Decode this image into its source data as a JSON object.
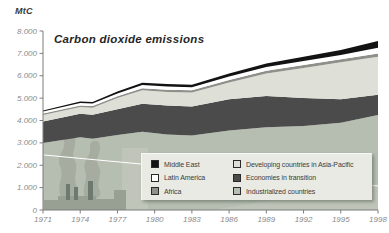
{
  "page": {
    "background": "#ffffff"
  },
  "chart_data": {
    "type": "area",
    "stacked": true,
    "title": "Carbon dioxide emissions",
    "unit_label": "MtC",
    "grid": false,
    "x": [
      1971,
      1974,
      1975,
      1977,
      1979,
      1981,
      1983,
      1986,
      1989,
      1992,
      1995,
      1998
    ],
    "x_axis": {
      "range": [
        1971,
        1998
      ],
      "tick_years": [
        1971,
        1974,
        1977,
        1980,
        1983,
        1986,
        1989,
        1992,
        1995,
        1998
      ],
      "tick_labels": [
        "1971",
        "1974",
        "1977",
        "1980",
        "1983",
        "1986",
        "1989",
        "1992",
        "1995",
        "1998"
      ]
    },
    "y_axis": {
      "range": [
        0,
        8000
      ],
      "ticks": [
        {
          "value": 8000,
          "label": "8.000"
        },
        {
          "value": 7000,
          "label": "7.000"
        },
        {
          "value": 6000,
          "label": "6.000"
        },
        {
          "value": 5000,
          "label": "5.000"
        },
        {
          "value": 4000,
          "label": "4.000"
        },
        {
          "value": 3000,
          "label": "3.000"
        },
        {
          "value": 2000,
          "label": "2.000"
        },
        {
          "value": 1000,
          "label": "1.000"
        },
        {
          "value": 0,
          "label": "0"
        }
      ]
    },
    "series": [
      {
        "name": "Industrialized countries",
        "color": "#b6bdb1",
        "values": [
          3000,
          3250,
          3180,
          3350,
          3500,
          3380,
          3330,
          3550,
          3700,
          3750,
          3900,
          4250
        ]
      },
      {
        "name": "Economies in transition",
        "color": "#4b4b4b",
        "values": [
          950,
          1050,
          1080,
          1150,
          1250,
          1290,
          1300,
          1400,
          1400,
          1250,
          1050,
          900
        ]
      },
      {
        "name": "Developing countries in Asia-Pacific",
        "color": "#dee0d7",
        "values": [
          300,
          300,
          310,
          500,
          600,
          610,
          620,
          750,
          1000,
          1350,
          1650,
          1700
        ]
      },
      {
        "name": "Africa",
        "color": "#8e9089",
        "values": [
          60,
          70,
          75,
          80,
          90,
          95,
          100,
          110,
          120,
          130,
          140,
          150
        ]
      },
      {
        "name": "Latin America",
        "color": "#ffffff",
        "values": [
          90,
          110,
          110,
          130,
          140,
          140,
          140,
          150,
          170,
          180,
          190,
          250
        ]
      },
      {
        "name": "Middle East",
        "color": "#131313",
        "values": [
          50,
          70,
          75,
          90,
          110,
          110,
          110,
          140,
          160,
          190,
          220,
          300
        ]
      }
    ],
    "legend": {
      "position": "bottom-right-overlay",
      "background": "#e9eae3",
      "columns": [
        [
          {
            "label": "Middle East",
            "color": "#131313"
          },
          {
            "label": "Latin America",
            "color": "#ffffff"
          },
          {
            "label": "Africa",
            "color": "#8e9089"
          }
        ],
        [
          {
            "label": "Developing countries in Asia-Pacific",
            "color": "#dee0d7"
          },
          {
            "label": "Economies in transition",
            "color": "#4b4b4b"
          },
          {
            "label": "Industrialized countries",
            "color": "#b6bdb1"
          }
        ]
      ]
    },
    "background_art": {
      "description": "faded factory with smokestacks watermark",
      "smoke_color": "#a6ada0",
      "factory_color": "#97a093",
      "chimney_color": "#6e7a70",
      "highlight_color": "#c6ccc0",
      "diagonal_line_color": "#ffffff"
    },
    "axis_color": "#7d7d7d",
    "tick_label_color": "#8a8a8a"
  }
}
